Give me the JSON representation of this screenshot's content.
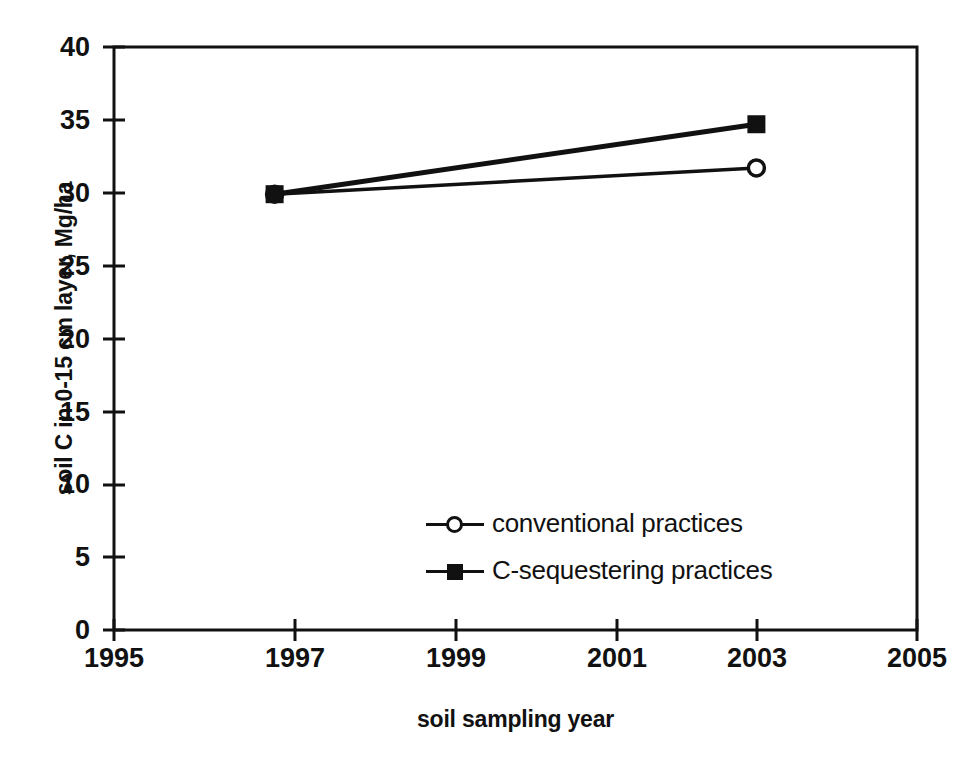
{
  "chart_data": {
    "type": "line",
    "title": "",
    "xlabel": "soil sampling year",
    "ylabel": "soil C in 0-15 cm layer, Mg/ha",
    "xlim": [
      1995,
      2005
    ],
    "ylim": [
      0,
      40
    ],
    "xticks": [
      "1995",
      "1997",
      "1999",
      "2001",
      "2003",
      "2005"
    ],
    "yticks": [
      "0",
      "5",
      "10",
      "15",
      "20",
      "25",
      "30",
      "35",
      "40"
    ],
    "xtick_values": [
      1995,
      1997,
      1999,
      2001,
      2003,
      2005
    ],
    "ytick_values": [
      0,
      5,
      10,
      15,
      20,
      25,
      30,
      35,
      40
    ],
    "grid": false,
    "legend_position": "center-right-inside",
    "x": [
      1997,
      2003
    ],
    "series": [
      {
        "name": "conventional practices",
        "marker": "open-circle",
        "color": "#111111",
        "values": [
          29.9,
          31.7
        ]
      },
      {
        "name": "C-sequestering practices",
        "marker": "filled-square",
        "color": "#111111",
        "values": [
          29.9,
          34.7
        ]
      }
    ]
  },
  "axes": {
    "y_title": "soil C in 0-15 cm layer, Mg/ha",
    "x_title": "soil sampling year"
  },
  "legend": {
    "items": [
      {
        "label": "conventional practices",
        "marker": "open-circle-marker-icon"
      },
      {
        "label": "C-sequestering practices",
        "marker": "filled-square-marker-icon"
      }
    ]
  },
  "ticks": {
    "y": [
      "40",
      "35",
      "30",
      "25",
      "20",
      "15",
      "10",
      "5",
      "0"
    ],
    "x": [
      "1995",
      "1997",
      "1999",
      "2001",
      "2003",
      "2005"
    ]
  },
  "colors": {
    "ink": "#111111",
    "background": "#ffffff"
  }
}
